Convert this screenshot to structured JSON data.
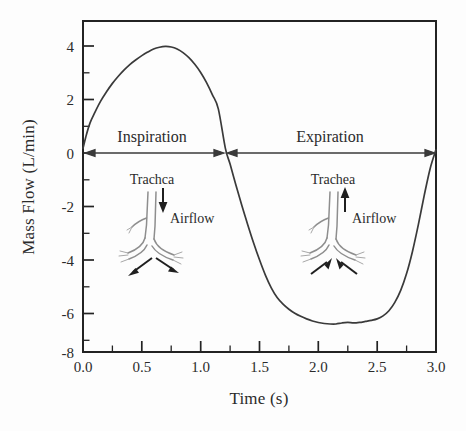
{
  "chart_data": {
    "type": "line",
    "title": "",
    "xlabel": "Time (s)",
    "ylabel": "Mass Flow (L/min)",
    "xlim": [
      0.0,
      3.0
    ],
    "ylim": [
      -8,
      5
    ],
    "grid": false,
    "legend": null,
    "x_ticks": [
      "0.0",
      "0.5",
      "1.0",
      "1.5",
      "2.0",
      "2.5",
      "3.0"
    ],
    "x_tick_values": [
      0.0,
      0.5,
      1.0,
      1.5,
      2.0,
      2.5,
      3.0
    ],
    "x_minor_step": 0.25,
    "y_ticks": [
      "4",
      "2",
      "0",
      "-2",
      "-4",
      "-6",
      "-8"
    ],
    "y_tick_values": [
      4,
      2,
      0,
      -2,
      -4,
      -6,
      -8
    ],
    "y_minor_step": 1,
    "series": [
      {
        "name": "Mass Flow",
        "x": [
          0.0,
          0.03,
          0.06,
          0.1,
          0.15,
          0.2,
          0.25,
          0.3,
          0.35,
          0.4,
          0.45,
          0.5,
          0.55,
          0.6,
          0.65,
          0.7,
          0.75,
          0.8,
          0.85,
          0.9,
          0.95,
          1.0,
          1.05,
          1.1,
          1.15,
          1.21,
          1.25,
          1.3,
          1.35,
          1.4,
          1.45,
          1.5,
          1.55,
          1.6,
          1.65,
          1.7,
          1.75,
          1.8,
          1.85,
          1.9,
          1.95,
          2.0,
          2.05,
          2.1,
          2.15,
          2.2,
          2.25,
          2.3,
          2.35,
          2.4,
          2.45,
          2.5,
          2.55,
          2.6,
          2.65,
          2.7,
          2.75,
          2.8,
          2.85,
          2.9,
          2.95,
          3.0
        ],
        "y": [
          0.0,
          0.55,
          1.0,
          1.4,
          1.85,
          2.22,
          2.55,
          2.83,
          3.08,
          3.3,
          3.48,
          3.64,
          3.78,
          3.9,
          3.97,
          4.0,
          3.98,
          3.9,
          3.76,
          3.56,
          3.3,
          2.98,
          2.58,
          2.1,
          1.55,
          0.0,
          -0.62,
          -1.45,
          -2.25,
          -3.0,
          -3.72,
          -4.38,
          -4.98,
          -5.48,
          -5.86,
          -6.12,
          -6.32,
          -6.48,
          -6.6,
          -6.7,
          -6.78,
          -6.84,
          -6.88,
          -6.9,
          -6.9,
          -6.86,
          -6.84,
          -6.86,
          -6.84,
          -6.8,
          -6.76,
          -6.7,
          -6.58,
          -6.38,
          -6.05,
          -5.58,
          -4.92,
          -4.05,
          -3.0,
          -1.85,
          -0.8,
          -0.05
        ],
        "peak_value": 4.0,
        "peak_time": 0.7,
        "trough_value": -6.9,
        "trough_time": 2.12,
        "zero_crossing_time": 1.21
      }
    ],
    "annotations": [
      {
        "name": "inspiration-span",
        "label": "Inspiration",
        "type": "double-arrow",
        "y": 0,
        "x_start": 0.0,
        "x_end": 1.21
      },
      {
        "name": "expiration-span",
        "label": "Expiration",
        "type": "double-arrow",
        "y": 0,
        "x_start": 1.21,
        "x_end": 3.0
      },
      {
        "name": "inspiration-airway-diagram",
        "trachea_label": "Trachca",
        "airflow_label": "Airflow",
        "flow_direction": "inward-down"
      },
      {
        "name": "expiration-airway-diagram",
        "trachea_label": "Trachea",
        "airflow_label": "Airflow",
        "flow_direction": "outward-up"
      }
    ]
  },
  "colors": {
    "background": "#fdfdfd",
    "axis": "#232323",
    "curve": "#3a3a3a",
    "annotation_arrow": "#3a3a3a",
    "airway": "#8e8e8e",
    "text": "#2b2b2b"
  }
}
